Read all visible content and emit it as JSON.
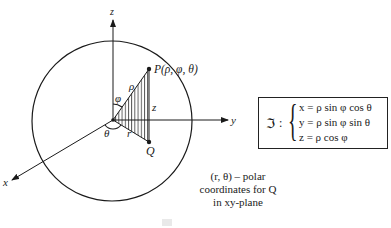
{
  "figure": {
    "axes": {
      "x_label": "x",
      "y_label": "y",
      "z_label": "z"
    },
    "points": {
      "P_label": "P(ρ, φ, θ)",
      "Q_label": "Q"
    },
    "segment_labels": {
      "rho": "ρ",
      "z": "z",
      "r": "r"
    },
    "angle_labels": {
      "phi": "φ",
      "theta": "θ"
    },
    "caption_lines": [
      "(r, θ) – polar",
      "coordinates for Q",
      "in xy-plane"
    ],
    "colors": {
      "ink": "#1a1a1a",
      "background": "#ffffff"
    }
  },
  "equations": {
    "name": "ℑ",
    "colon": ":",
    "lines": [
      "x = ρ sin φ cos θ",
      "y = ρ sin φ sin θ",
      "z = ρ cos φ"
    ]
  }
}
